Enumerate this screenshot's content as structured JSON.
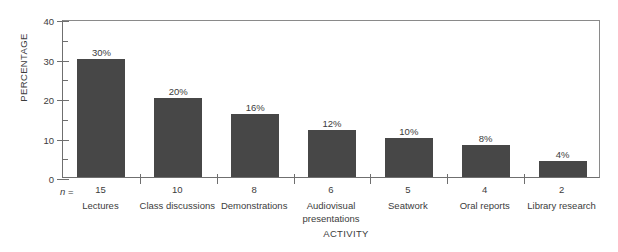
{
  "chart_data": {
    "type": "bar",
    "title": "",
    "xlabel": "ACTIVITY",
    "ylabel": "PERCENTAGE",
    "ylim": [
      0,
      40
    ],
    "y_major_ticks": [
      0,
      10,
      20,
      30,
      40
    ],
    "y_minor_ticks": [
      5,
      15,
      25,
      35
    ],
    "grid": false,
    "legend": null,
    "n_prefix": "n =",
    "categories": [
      "Lectures",
      "Class discussions",
      "Demonstrations",
      "Audiovisual presentations",
      "Seatwork",
      "Oral reports",
      "Library research"
    ],
    "values": [
      30,
      20,
      16,
      12,
      10,
      8,
      4
    ],
    "value_labels": [
      "30%",
      "20%",
      "16%",
      "12%",
      "10%",
      "8%",
      "4%"
    ],
    "n_values": [
      15,
      10,
      8,
      6,
      5,
      4,
      2
    ],
    "bar_color": "#474747",
    "axis_color": "#6f6f6f",
    "text_color": "#3c3c3c",
    "background": "#ffffff"
  }
}
